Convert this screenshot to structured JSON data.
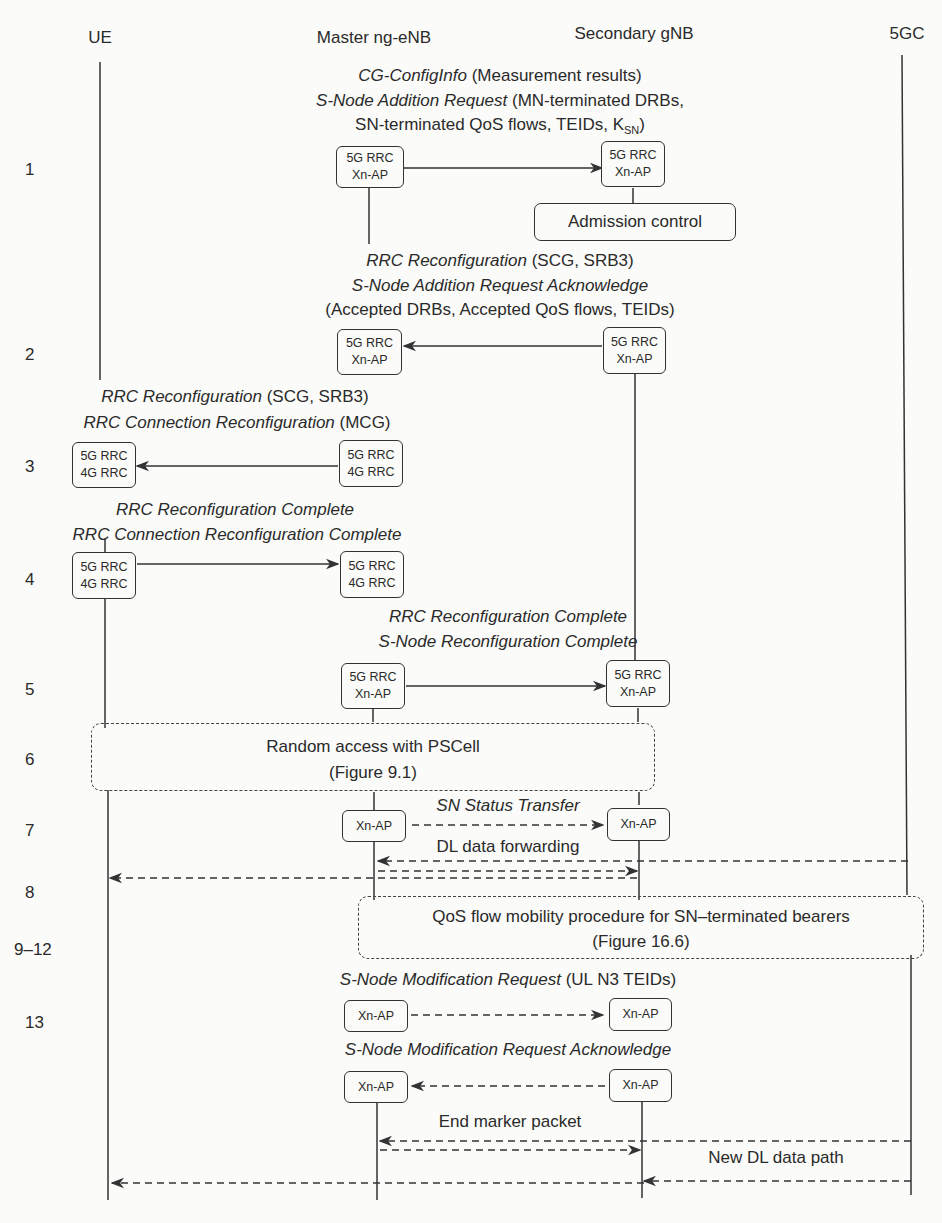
{
  "participants": [
    {
      "id": "ue",
      "label": "UE"
    },
    {
      "id": "mn",
      "label": "Master ng-eNB"
    },
    {
      "id": "sn",
      "label": "Secondary gNB"
    },
    {
      "id": "core",
      "label": "5GC"
    }
  ],
  "steps": [
    {
      "num": "1",
      "messages": [
        {
          "italic": "CG-ConfigInfo",
          "plain": " (Measurement results)"
        },
        {
          "italic": "S-Node Addition Request",
          "plain": " (MN-terminated DRBs,"
        },
        {
          "plain": "SN-terminated QoS flows, TEIDs, K",
          "sub": "SN",
          "plain2": ")"
        }
      ],
      "from_box": [
        "5G RRC",
        "Xn-AP"
      ],
      "to_box": [
        "5G RRC",
        "Xn-AP"
      ],
      "action": "Admission control"
    },
    {
      "num": "2",
      "messages": [
        {
          "italic": "RRC Reconfiguration",
          "plain": " (SCG, SRB3)"
        },
        {
          "italic": "S-Node Addition Request Acknowledge",
          "plain": ""
        },
        {
          "plain": "(Accepted DRBs, Accepted QoS flows, TEIDs)"
        }
      ],
      "from_box": [
        "5G RRC",
        "Xn-AP"
      ],
      "to_box": [
        "5G RRC",
        "Xn-AP"
      ]
    },
    {
      "num": "3",
      "messages": [
        {
          "italic": "RRC Reconfiguration",
          "plain": " (SCG, SRB3)"
        },
        {
          "italic": "RRC Connection Reconfiguration",
          "plain": " (MCG)"
        }
      ],
      "from_box": [
        "5G RRC",
        "4G RRC"
      ],
      "to_box": [
        "5G RRC",
        "4G RRC"
      ]
    },
    {
      "num": "4",
      "messages": [
        {
          "italic": "RRC Reconfiguration Complete",
          "plain": ""
        },
        {
          "italic": "RRC Connection Reconfiguration Complete",
          "plain": ""
        }
      ],
      "from_box": [
        "5G RRC",
        "4G RRC"
      ],
      "to_box": [
        "5G RRC",
        "4G RRC"
      ]
    },
    {
      "num": "5",
      "messages": [
        {
          "italic": "RRC Reconfiguration Complete",
          "plain": ""
        },
        {
          "italic": "S-Node Reconfiguration Complete",
          "plain": ""
        }
      ],
      "from_box": [
        "5G RRC",
        "Xn-AP"
      ],
      "to_box": [
        "5G RRC",
        "Xn-AP"
      ]
    },
    {
      "num": "6",
      "procedure": [
        "Random access with PSCell",
        "(Figure 9.1)"
      ]
    },
    {
      "num": "7",
      "messages": [
        {
          "italic": "SN Status Transfer",
          "plain": ""
        }
      ],
      "from_box": [
        "Xn-AP"
      ],
      "to_box": [
        "Xn-AP"
      ],
      "data_label": "DL data forwarding"
    },
    {
      "num": "8"
    },
    {
      "num": "9–12",
      "procedure": [
        "QoS flow mobility procedure for SN–terminated bearers",
        "(Figure 16.6)"
      ]
    },
    {
      "num": "13",
      "messages": [
        {
          "italic": "S-Node Modification Request",
          "plain": " (UL N3 TEIDs)"
        },
        {
          "italic": "S-Node Modification Request Acknowledge",
          "plain": ""
        }
      ],
      "box": "Xn-AP",
      "end_marker": "End marker packet",
      "new_path": "New DL data path"
    }
  ]
}
